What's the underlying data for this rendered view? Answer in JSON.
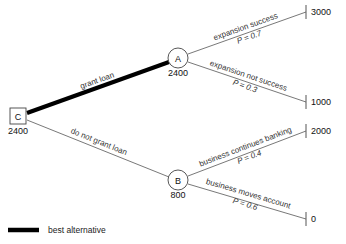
{
  "diagram": {
    "type": "decision-tree",
    "title": "",
    "nodes": [
      {
        "id": "C",
        "label": "C",
        "shape": "square",
        "kind": "decision",
        "value": "2400",
        "x": 18,
        "y": 116
      },
      {
        "id": "A",
        "label": "A",
        "shape": "circle",
        "kind": "chance",
        "value": "2400",
        "x": 178,
        "y": 58
      },
      {
        "id": "B",
        "label": "B",
        "shape": "circle",
        "kind": "chance",
        "value": "800",
        "x": 178,
        "y": 180
      }
    ],
    "branches": [
      {
        "id": "grant-loan",
        "from": "C",
        "to": "A",
        "label": "grant loan",
        "probability": "",
        "best": true
      },
      {
        "id": "do-not-grant-loan",
        "from": "C",
        "to": "B",
        "label": "do not grant loan",
        "probability": "",
        "best": false
      },
      {
        "id": "expansion-success",
        "from": "A",
        "to": "terminal-3000",
        "label": "expansion success",
        "probability": "P = 0.7",
        "best": false
      },
      {
        "id": "expansion-not-success",
        "from": "A",
        "to": "terminal-1000",
        "label": "expansion not success",
        "probability": "P = 0.3",
        "best": false
      },
      {
        "id": "business-continues-banking",
        "from": "B",
        "to": "terminal-2000",
        "label": "business continues banking",
        "probability": "P = 0.4",
        "best": false
      },
      {
        "id": "business-moves-account",
        "from": "B",
        "to": "terminal-0",
        "label": "business moves account",
        "probability": "P = 0.6",
        "best": false
      }
    ],
    "terminals": [
      {
        "id": "terminal-3000",
        "payoff": "3000",
        "x": 307,
        "y": 12
      },
      {
        "id": "terminal-1000",
        "payoff": "1000",
        "x": 307,
        "y": 102
      },
      {
        "id": "terminal-2000",
        "payoff": "2000",
        "x": 307,
        "y": 131
      },
      {
        "id": "terminal-0",
        "payoff": "0",
        "x": 307,
        "y": 219
      }
    ],
    "legend": {
      "swatch": "best-alternative-line",
      "label": "best alternative",
      "color": "#000000"
    }
  }
}
